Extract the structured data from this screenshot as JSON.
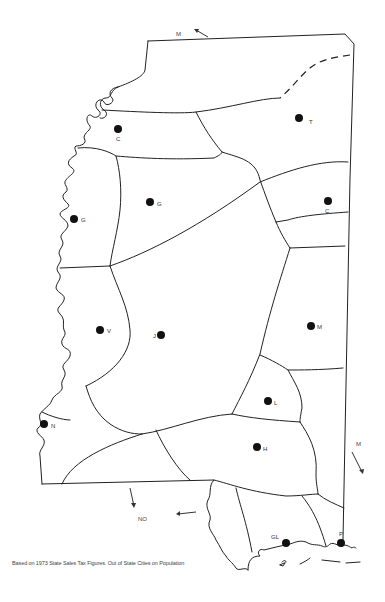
{
  "map": {
    "title": "Mississippi trade areas map",
    "caption": "Based on 1973 State Sales Tax Figures.  Out of State Cities on Population",
    "cities": [
      {
        "label": "C",
        "x": 118,
        "y": 129,
        "lx": 116,
        "ly": 141
      },
      {
        "label": "T",
        "x": 299,
        "y": 118,
        "lx": 309,
        "ly": 124
      },
      {
        "label": "G",
        "x": 150,
        "y": 202,
        "lx": 157,
        "ly": 206
      },
      {
        "label": "C",
        "x": 328,
        "y": 201,
        "lx": 325,
        "ly": 213
      },
      {
        "label": "G",
        "x": 74,
        "y": 219,
        "lx": 81,
        "ly": 222
      },
      {
        "label": "V",
        "x": 100,
        "y": 330,
        "lx": 107,
        "ly": 333
      },
      {
        "label": "J",
        "x": 161,
        "y": 335,
        "lx": 153,
        "ly": 338
      },
      {
        "label": "M",
        "x": 311,
        "y": 326,
        "lx": 317,
        "ly": 329
      },
      {
        "label": "L",
        "x": 268,
        "y": 401,
        "lx": 274,
        "ly": 405
      },
      {
        "label": "N",
        "x": 44,
        "y": 424,
        "lx": 51,
        "ly": 428
      },
      {
        "label": "H",
        "x": 257,
        "y": 447,
        "lx": 263,
        "ly": 451
      },
      {
        "label": "GL",
        "x": 286,
        "y": 543,
        "lx": 271,
        "ly": 539
      },
      {
        "label": "P",
        "x": 341,
        "y": 543,
        "lx": 339,
        "ly": 536
      }
    ],
    "external_cities": [
      {
        "label": "M",
        "x": 176,
        "y": 36,
        "note": "top arrow"
      },
      {
        "label": "M",
        "x": 356,
        "y": 446,
        "note": "right arrow"
      },
      {
        "label": "NO",
        "x": 138,
        "y": 521,
        "note": "bottom-left"
      }
    ],
    "colors": {
      "ink": "#222222",
      "background": "#ffffff"
    }
  }
}
